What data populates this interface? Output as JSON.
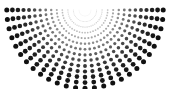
{
  "figure": {
    "width": 169,
    "height": 89,
    "background_color": "#ffffff"
  },
  "chart_data": {
    "type": "scatter",
    "title": "",
    "subtitle": "",
    "xlabel": "",
    "ylabel": "",
    "xlim": [
      0,
      169
    ],
    "ylim": [
      0,
      89
    ],
    "grid": false,
    "legend": null,
    "annotations": [],
    "marker": "circle",
    "origin": {
      "x": 85,
      "y": 10
    },
    "geometry": {
      "pattern": "polar-grid",
      "angle_start_deg": 0,
      "angle_end_deg": 180,
      "ray_count": 27,
      "ring_count": 14,
      "ring_radius_min": 6,
      "ring_radius_step": 5.55,
      "dot_radius_min": 0.35,
      "dot_radius_max": 2.5,
      "color_near": "#e8e8e8",
      "color_far": "#111111"
    },
    "series": [
      {
        "name": "radial-dots",
        "color": "#111111",
        "description": "Each point lies at polar coordinate (ring r, ray angle) measured from the origin; angle 0 deg points right along the top edge, 180 deg points left.",
        "rings": [
          {
            "index": 0,
            "radius": 6.0,
            "dot_radius": 0.35,
            "color": "#ececec"
          },
          {
            "index": 1,
            "radius": 11.6,
            "dot_radius": 0.5,
            "color": "#e0e0e0"
          },
          {
            "index": 2,
            "radius": 17.1,
            "dot_radius": 0.68,
            "color": "#d0d0d0"
          },
          {
            "index": 3,
            "radius": 22.7,
            "dot_radius": 0.86,
            "color": "#bdbdbd"
          },
          {
            "index": 4,
            "radius": 28.2,
            "dot_radius": 1.04,
            "color": "#a6a6a6"
          },
          {
            "index": 5,
            "radius": 33.8,
            "dot_radius": 1.22,
            "color": "#8d8d8d"
          },
          {
            "index": 6,
            "radius": 39.3,
            "dot_radius": 1.4,
            "color": "#757575"
          },
          {
            "index": 7,
            "radius": 44.9,
            "dot_radius": 1.58,
            "color": "#5e5e5e"
          },
          {
            "index": 8,
            "radius": 50.4,
            "dot_radius": 1.76,
            "color": "#4a4a4a"
          },
          {
            "index": 9,
            "radius": 56.0,
            "dot_radius": 1.94,
            "color": "#383838"
          },
          {
            "index": 10,
            "radius": 61.5,
            "dot_radius": 2.12,
            "color": "#2a2a2a"
          },
          {
            "index": 11,
            "radius": 67.1,
            "dot_radius": 2.28,
            "color": "#1e1e1e"
          },
          {
            "index": 12,
            "radius": 72.6,
            "dot_radius": 2.4,
            "color": "#161616"
          },
          {
            "index": 13,
            "radius": 78.2,
            "dot_radius": 2.5,
            "color": "#111111"
          }
        ],
        "rays_deg": [
          0,
          6.92,
          13.85,
          20.77,
          27.69,
          34.62,
          41.54,
          48.46,
          55.38,
          62.31,
          69.23,
          76.15,
          83.08,
          90,
          96.92,
          103.85,
          110.77,
          117.69,
          124.62,
          131.54,
          138.46,
          145.38,
          152.31,
          159.23,
          166.15,
          173.08,
          180
        ]
      }
    ]
  }
}
